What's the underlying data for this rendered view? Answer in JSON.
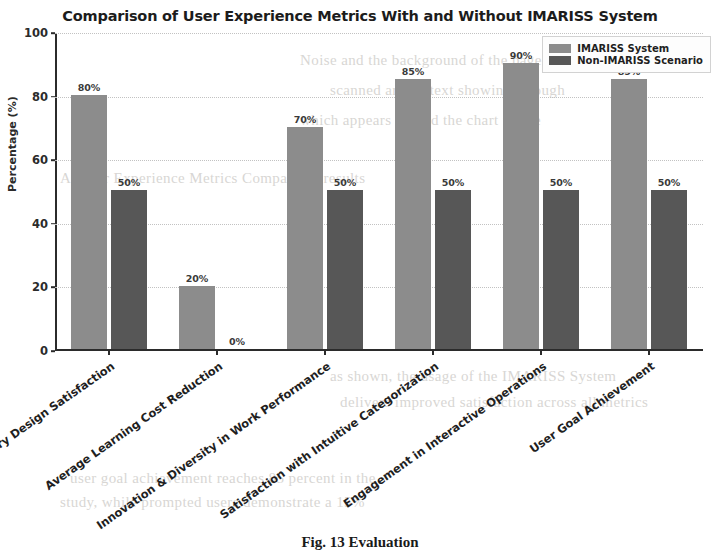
{
  "chart_data": {
    "type": "bar",
    "title": "Comparison of User Experience Metrics With and Without IMARISS System",
    "xlabel": "",
    "ylabel": "Percentage (%)",
    "ylim": [
      0,
      100
    ],
    "yticks": [
      0,
      20,
      40,
      60,
      80,
      100
    ],
    "ytick_labels": [
      "0",
      "20",
      "40",
      "60",
      "80",
      "100"
    ],
    "grid": true,
    "grid_axis": "y",
    "legend_position": "upper right",
    "categories": [
      "Participatory Design Satisfaction",
      "Average Learning Cost Reduction",
      "Innovation & Diversity in Work Performance",
      "Satisfaction with Intuitive Categorization",
      "Engagement in Interactive Operations",
      "User Goal Achievement"
    ],
    "series": [
      {
        "name": "IMARISS System",
        "color": "#8c8c8c",
        "values": [
          80,
          20,
          70,
          85,
          90,
          85
        ],
        "value_labels": [
          "80%",
          "20%",
          "70%",
          "85%",
          "90%",
          "85%"
        ]
      },
      {
        "name": "Non-IMARISS Scenario",
        "color": "#575757",
        "values": [
          50,
          0,
          50,
          50,
          50,
          50
        ],
        "value_labels": [
          "50%",
          "0%",
          "50%",
          "50%",
          "50%",
          "50%"
        ]
      }
    ]
  },
  "figure": {
    "caption": "Fig. 13  Evaluation"
  },
  "page_bleed": [
    "Noise and the background of the page is from",
    "scanned article text showing through",
    "which appears behind the chart figure",
    "A. User Experience Metrics Comparison results",
    "as shown, the usage of the IMARISS System",
    "delivers improved satisfaction across all metrics",
    "user goal achievement reaches 85 percent in the",
    "study, while prompted users demonstrate a 15%"
  ]
}
